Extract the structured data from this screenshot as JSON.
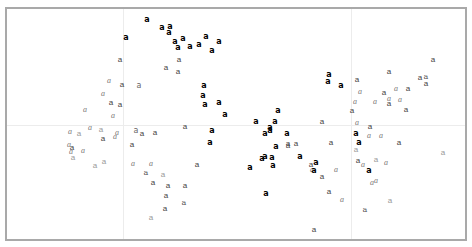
{
  "chart_data": {
    "type": "scatter",
    "title": "",
    "xlabel": "",
    "ylabel": "",
    "grid": true,
    "legend": null,
    "glyph": "a",
    "gridlines": {
      "x_px": [
        123,
        351
      ],
      "y_px": [
        125
      ]
    },
    "points": [
      {
        "x": 147,
        "y": 20,
        "label": "a",
        "style": "bold"
      },
      {
        "x": 162,
        "y": 28,
        "label": "a",
        "style": "bold"
      },
      {
        "x": 170,
        "y": 27,
        "label": "a",
        "style": "bold"
      },
      {
        "x": 169,
        "y": 33,
        "label": "a",
        "style": "bold"
      },
      {
        "x": 126,
        "y": 38,
        "label": "a",
        "style": "bold"
      },
      {
        "x": 175,
        "y": 42,
        "label": "a",
        "style": "bold"
      },
      {
        "x": 183,
        "y": 39,
        "label": "a",
        "style": "bold"
      },
      {
        "x": 178,
        "y": 48,
        "label": "a",
        "style": "bold"
      },
      {
        "x": 190,
        "y": 47,
        "label": "a",
        "style": "bold"
      },
      {
        "x": 199,
        "y": 45,
        "label": "a",
        "style": "bold"
      },
      {
        "x": 206,
        "y": 37,
        "label": "a",
        "style": "bold"
      },
      {
        "x": 219,
        "y": 42,
        "label": "a",
        "style": "bold"
      },
      {
        "x": 212,
        "y": 51,
        "label": "a",
        "style": "bold"
      },
      {
        "x": 120,
        "y": 60,
        "label": "a",
        "style": "sans"
      },
      {
        "x": 179,
        "y": 60,
        "label": "a",
        "style": "sans"
      },
      {
        "x": 166,
        "y": 68,
        "label": "a",
        "style": "sans"
      },
      {
        "x": 178,
        "y": 72,
        "label": "a",
        "style": "sans"
      },
      {
        "x": 109,
        "y": 81,
        "label": "a",
        "style": "italic"
      },
      {
        "x": 122,
        "y": 85,
        "label": "a",
        "style": "sans"
      },
      {
        "x": 139,
        "y": 86,
        "label": "a",
        "style": "mono"
      },
      {
        "x": 204,
        "y": 86,
        "label": "a",
        "style": "bold"
      },
      {
        "x": 203,
        "y": 96,
        "label": "a",
        "style": "bold"
      },
      {
        "x": 205,
        "y": 105,
        "label": "a",
        "style": "bold"
      },
      {
        "x": 219,
        "y": 103,
        "label": "a",
        "style": "bold"
      },
      {
        "x": 103,
        "y": 94,
        "label": "a",
        "style": "italic"
      },
      {
        "x": 111,
        "y": 103,
        "label": "a",
        "style": "sans"
      },
      {
        "x": 120,
        "y": 105,
        "label": "a",
        "style": "sans"
      },
      {
        "x": 85,
        "y": 110,
        "label": "a",
        "style": "italic"
      },
      {
        "x": 113,
        "y": 116,
        "label": "a",
        "style": "italic"
      },
      {
        "x": 225,
        "y": 115,
        "label": "a",
        "style": "bold"
      },
      {
        "x": 185,
        "y": 186,
        "label": "a",
        "style": "sans"
      },
      {
        "x": 70,
        "y": 132,
        "label": "a",
        "style": "italic"
      },
      {
        "x": 79,
        "y": 134,
        "label": "a",
        "style": "light"
      },
      {
        "x": 90,
        "y": 128,
        "label": "a",
        "style": "italic"
      },
      {
        "x": 101,
        "y": 130,
        "label": "a",
        "style": "light"
      },
      {
        "x": 103,
        "y": 139,
        "label": "a",
        "style": "sans"
      },
      {
        "x": 115,
        "y": 137,
        "label": "a",
        "style": "italic"
      },
      {
        "x": 117,
        "y": 133,
        "label": "a",
        "style": "italic"
      },
      {
        "x": 69,
        "y": 145,
        "label": "a",
        "style": "italic"
      },
      {
        "x": 72,
        "y": 148,
        "label": "a",
        "style": "sans"
      },
      {
        "x": 71,
        "y": 152,
        "label": "a",
        "style": "italic"
      },
      {
        "x": 83,
        "y": 151,
        "label": "a",
        "style": "italic"
      },
      {
        "x": 73,
        "y": 158,
        "label": "a",
        "style": "light"
      },
      {
        "x": 95,
        "y": 166,
        "label": "a",
        "style": "light"
      },
      {
        "x": 104,
        "y": 162,
        "label": "a",
        "style": "light"
      },
      {
        "x": 136,
        "y": 131,
        "label": "a",
        "style": "mono"
      },
      {
        "x": 142,
        "y": 134,
        "label": "a",
        "style": "sans"
      },
      {
        "x": 155,
        "y": 133,
        "label": "a",
        "style": "sans"
      },
      {
        "x": 132,
        "y": 145,
        "label": "a",
        "style": "sans"
      },
      {
        "x": 185,
        "y": 127,
        "label": "a",
        "style": "sans"
      },
      {
        "x": 212,
        "y": 131,
        "label": "a",
        "style": "bold"
      },
      {
        "x": 210,
        "y": 143,
        "label": "a",
        "style": "bold"
      },
      {
        "x": 197,
        "y": 165,
        "label": "a",
        "style": "sans"
      },
      {
        "x": 133,
        "y": 164,
        "label": "a",
        "style": "italic"
      },
      {
        "x": 151,
        "y": 164,
        "label": "a",
        "style": "italic"
      },
      {
        "x": 146,
        "y": 173,
        "label": "a",
        "style": "serif"
      },
      {
        "x": 163,
        "y": 175,
        "label": "a",
        "style": "light"
      },
      {
        "x": 153,
        "y": 183,
        "label": "a",
        "style": "sans"
      },
      {
        "x": 168,
        "y": 186,
        "label": "a",
        "style": "sans"
      },
      {
        "x": 166,
        "y": 196,
        "label": "a",
        "style": "sans"
      },
      {
        "x": 184,
        "y": 203,
        "label": "a",
        "style": "serif"
      },
      {
        "x": 165,
        "y": 209,
        "label": "a",
        "style": "sans"
      },
      {
        "x": 151,
        "y": 218,
        "label": "a",
        "style": "light"
      },
      {
        "x": 329,
        "y": 75,
        "label": "a",
        "style": "bold"
      },
      {
        "x": 328,
        "y": 82,
        "label": "a",
        "style": "bold"
      },
      {
        "x": 341,
        "y": 86,
        "label": "a",
        "style": "bold"
      },
      {
        "x": 357,
        "y": 80,
        "label": "a",
        "style": "sans"
      },
      {
        "x": 360,
        "y": 92,
        "label": "a",
        "style": "italic"
      },
      {
        "x": 355,
        "y": 102,
        "label": "a",
        "style": "italic"
      },
      {
        "x": 352,
        "y": 111,
        "label": "a",
        "style": "sans"
      },
      {
        "x": 375,
        "y": 102,
        "label": "a",
        "style": "italic"
      },
      {
        "x": 389,
        "y": 72,
        "label": "a",
        "style": "sans"
      },
      {
        "x": 384,
        "y": 93,
        "label": "a",
        "style": "sans"
      },
      {
        "x": 389,
        "y": 99,
        "label": "a",
        "style": "italic"
      },
      {
        "x": 389,
        "y": 104,
        "label": "a",
        "style": "sans"
      },
      {
        "x": 396,
        "y": 89,
        "label": "a",
        "style": "italic"
      },
      {
        "x": 400,
        "y": 100,
        "label": "a",
        "style": "italic"
      },
      {
        "x": 408,
        "y": 89,
        "label": "a",
        "style": "sans"
      },
      {
        "x": 406,
        "y": 110,
        "label": "a",
        "style": "sans"
      },
      {
        "x": 420,
        "y": 78,
        "label": "a",
        "style": "sans"
      },
      {
        "x": 426,
        "y": 77,
        "label": "a",
        "style": "serif"
      },
      {
        "x": 426,
        "y": 84,
        "label": "a",
        "style": "sans"
      },
      {
        "x": 433,
        "y": 60,
        "label": "a",
        "style": "sans"
      },
      {
        "x": 278,
        "y": 111,
        "label": "a",
        "style": "bold"
      },
      {
        "x": 256,
        "y": 122,
        "label": "a",
        "style": "bold"
      },
      {
        "x": 275,
        "y": 122,
        "label": "a",
        "style": "bold"
      },
      {
        "x": 270,
        "y": 128,
        "label": "a",
        "style": "bold"
      },
      {
        "x": 270,
        "y": 131,
        "label": "a",
        "style": "bold"
      },
      {
        "x": 265,
        "y": 134,
        "label": "a",
        "style": "bold"
      },
      {
        "x": 287,
        "y": 134,
        "label": "a",
        "style": "bold"
      },
      {
        "x": 322,
        "y": 122,
        "label": "a",
        "style": "sans"
      },
      {
        "x": 357,
        "y": 123,
        "label": "a",
        "style": "italic"
      },
      {
        "x": 370,
        "y": 127,
        "label": "a",
        "style": "sans"
      },
      {
        "x": 288,
        "y": 144,
        "label": "a",
        "style": "sans"
      },
      {
        "x": 276,
        "y": 147,
        "label": "a",
        "style": "bold"
      },
      {
        "x": 288,
        "y": 146,
        "label": "a",
        "style": "sans"
      },
      {
        "x": 296,
        "y": 144,
        "label": "a",
        "style": "sans"
      },
      {
        "x": 331,
        "y": 143,
        "label": "a",
        "style": "sans"
      },
      {
        "x": 356,
        "y": 134,
        "label": "a",
        "style": "bold"
      },
      {
        "x": 359,
        "y": 143,
        "label": "a",
        "style": "bold"
      },
      {
        "x": 369,
        "y": 136,
        "label": "a",
        "style": "italic"
      },
      {
        "x": 381,
        "y": 136,
        "label": "a",
        "style": "italic"
      },
      {
        "x": 399,
        "y": 143,
        "label": "a",
        "style": "sans"
      },
      {
        "x": 443,
        "y": 153,
        "label": "a",
        "style": "light"
      },
      {
        "x": 356,
        "y": 150,
        "label": "a",
        "style": "light"
      },
      {
        "x": 300,
        "y": 157,
        "label": "a",
        "style": "bold"
      },
      {
        "x": 262,
        "y": 159,
        "label": "a",
        "style": "bold"
      },
      {
        "x": 265,
        "y": 157,
        "label": "a",
        "style": "bold"
      },
      {
        "x": 272,
        "y": 158,
        "label": "a",
        "style": "bold"
      },
      {
        "x": 250,
        "y": 168,
        "label": "a",
        "style": "bold"
      },
      {
        "x": 273,
        "y": 166,
        "label": "a",
        "style": "bold"
      },
      {
        "x": 316,
        "y": 163,
        "label": "a",
        "style": "bold"
      },
      {
        "x": 311,
        "y": 165,
        "label": "a",
        "style": "sans"
      },
      {
        "x": 312,
        "y": 170,
        "label": "a",
        "style": "italic"
      },
      {
        "x": 314,
        "y": 171,
        "label": "a",
        "style": "bold"
      },
      {
        "x": 322,
        "y": 177,
        "label": "a",
        "style": "sans"
      },
      {
        "x": 336,
        "y": 170,
        "label": "a",
        "style": "italic"
      },
      {
        "x": 358,
        "y": 161,
        "label": "a",
        "style": "sans"
      },
      {
        "x": 363,
        "y": 165,
        "label": "a",
        "style": "italic"
      },
      {
        "x": 369,
        "y": 171,
        "label": "a",
        "style": "bold"
      },
      {
        "x": 376,
        "y": 160,
        "label": "a",
        "style": "light"
      },
      {
        "x": 386,
        "y": 163,
        "label": "a",
        "style": "italic"
      },
      {
        "x": 372,
        "y": 183,
        "label": "a",
        "style": "italic"
      },
      {
        "x": 376,
        "y": 181,
        "label": "a",
        "style": "italic"
      },
      {
        "x": 266,
        "y": 194,
        "label": "a",
        "style": "bold"
      },
      {
        "x": 329,
        "y": 192,
        "label": "a",
        "style": "sans"
      },
      {
        "x": 342,
        "y": 200,
        "label": "a",
        "style": "italic"
      },
      {
        "x": 390,
        "y": 201,
        "label": "a",
        "style": "light"
      },
      {
        "x": 365,
        "y": 210,
        "label": "a",
        "style": "serif"
      },
      {
        "x": 314,
        "y": 230,
        "label": "a",
        "style": "sans"
      }
    ]
  }
}
